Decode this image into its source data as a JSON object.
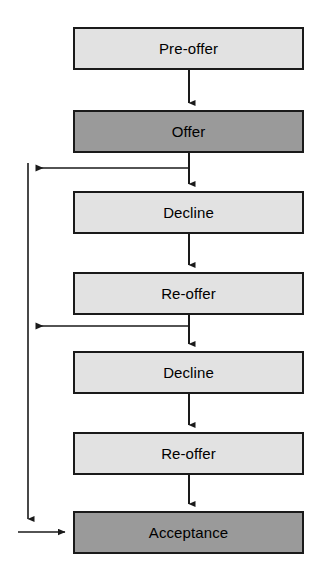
{
  "diagram": {
    "type": "flowchart",
    "orientation": "vertical-top-down",
    "canvas": {
      "width": 324,
      "height": 584,
      "background": "#ffffff"
    },
    "palette": {
      "light_fill": "#e2e2e2",
      "dark_fill": "#9a9a9a",
      "stroke": "#1a1a1a",
      "text": "#000000"
    },
    "nodes": [
      {
        "id": "pre-offer",
        "label": "Pre-offer",
        "style": "light",
        "x": 73,
        "y": 27,
        "w": 231,
        "h": 43
      },
      {
        "id": "offer",
        "label": "Offer",
        "style": "dark",
        "x": 73,
        "y": 110,
        "w": 231,
        "h": 43
      },
      {
        "id": "decline-1",
        "label": "Decline",
        "style": "light",
        "x": 73,
        "y": 191,
        "w": 231,
        "h": 43
      },
      {
        "id": "re-offer-1",
        "label": "Re-offer",
        "style": "light",
        "x": 73,
        "y": 272,
        "w": 231,
        "h": 43
      },
      {
        "id": "decline-2",
        "label": "Decline",
        "style": "light",
        "x": 73,
        "y": 351,
        "w": 231,
        "h": 43
      },
      {
        "id": "re-offer-2",
        "label": "Re-offer",
        "style": "light",
        "x": 73,
        "y": 432,
        "w": 231,
        "h": 43
      },
      {
        "id": "acceptance",
        "label": "Acceptance",
        "style": "dark",
        "x": 73,
        "y": 511,
        "w": 231,
        "h": 43
      }
    ],
    "edges": [
      {
        "id": "e-pre-offer-to-offer",
        "from": "pre-offer",
        "to": "offer",
        "kind": "straight-down"
      },
      {
        "id": "e-offer-to-decline-1",
        "from": "offer",
        "to": "decline-1",
        "kind": "straight-down"
      },
      {
        "id": "e-decline-1-to-re-offer-1",
        "from": "decline-1",
        "to": "re-offer-1",
        "kind": "straight-down"
      },
      {
        "id": "e-re-offer-1-to-decline-2",
        "from": "re-offer-1",
        "to": "decline-2",
        "kind": "straight-down"
      },
      {
        "id": "e-decline-2-to-re-offer-2",
        "from": "decline-2",
        "to": "re-offer-2",
        "kind": "straight-down"
      },
      {
        "id": "e-re-offer-2-to-acceptance",
        "from": "re-offer-2",
        "to": "acceptance",
        "kind": "straight-down"
      },
      {
        "id": "e-offer-branch-left",
        "from": "offer",
        "to": "return-rail",
        "kind": "branch-left",
        "at_y": 168
      },
      {
        "id": "e-re-offer-1-branch-left",
        "from": "re-offer-1",
        "to": "return-rail",
        "kind": "branch-left",
        "at_y": 326
      },
      {
        "id": "e-return-rail-down",
        "from": "return-rail",
        "to": "acceptance-feed",
        "kind": "vertical-rail"
      },
      {
        "id": "e-acceptance-feed",
        "from": "acceptance-feed",
        "to": "acceptance",
        "kind": "horizontal-into-left"
      }
    ]
  }
}
